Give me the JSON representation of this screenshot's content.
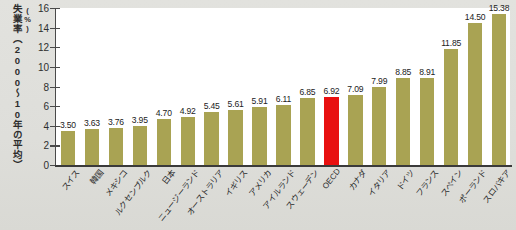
{
  "chart_data": {
    "type": "bar",
    "title": "",
    "ylabel": "失業率（2000～10年の平均）(%)",
    "xlabel": "",
    "ylim": [
      0,
      16
    ],
    "yticks": [
      0,
      2,
      4,
      6,
      8,
      10,
      12,
      14,
      16
    ],
    "grid": false,
    "legend": null,
    "categories": [
      "スイス",
      "韓国",
      "メキシコ",
      "ルクセンブルク",
      "日本",
      "ニュージーランド",
      "オーストラリア",
      "イギリス",
      "アメリカ",
      "アイルランド",
      "スウェーデン",
      "OECD",
      "カナダ",
      "イタリア",
      "ドイツ",
      "フランス",
      "スペイン",
      "ポーランド",
      "スロバキア"
    ],
    "values": [
      3.5,
      3.63,
      3.76,
      3.95,
      4.7,
      4.92,
      5.45,
      5.61,
      5.91,
      6.11,
      6.85,
      6.92,
      7.09,
      7.99,
      8.85,
      8.91,
      11.85,
      14.5,
      15.38
    ],
    "value_labels": [
      "3.50",
      "3.63",
      "3.76",
      "3.95",
      "4.70",
      "4.92",
      "5.45",
      "5.61",
      "5.91",
      "6.11",
      "6.85",
      "6.92",
      "7.09",
      "7.99",
      "8.85",
      "8.91",
      "11.85",
      "14.50",
      "15.38"
    ],
    "highlight_index": 11,
    "colors": {
      "bar": "#a9a353",
      "highlight": "#e81010",
      "plot_background": "#ffffff",
      "page_background": "#dededa",
      "axis": "#3a3a3a",
      "text": "#2a2a2a"
    }
  },
  "axis_title": {
    "main": "失業率（2000～10年の平均）",
    "unit": "(%)"
  }
}
